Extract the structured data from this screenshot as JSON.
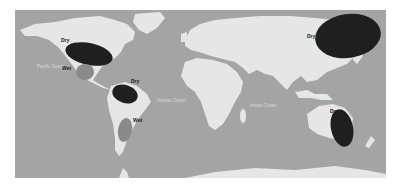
{
  "map": {
    "title": "",
    "colors": {
      "ocean": "#a4a4a4",
      "land": "#e6e6e6",
      "dry": "#1f1f1f",
      "wet": "#8a8a8a",
      "ocean_label": "#d8d8d8",
      "zone_label": "#1a1a1a"
    },
    "oceans": [
      {
        "label": "Pacific Ocean",
        "x": 22,
        "y": 58
      },
      {
        "label": "Atlantic Ocean",
        "x": 142,
        "y": 92
      },
      {
        "label": "Indian Ocean",
        "x": 235,
        "y": 97
      }
    ],
    "zones": [
      {
        "name": "north-america-dry",
        "label": "Dry",
        "type": "dry",
        "cx": 74,
        "cy": 44,
        "rx": 24,
        "ry": 11,
        "rot": 12,
        "lx": 46,
        "ly": 32
      },
      {
        "name": "mexico-wet",
        "label": "Wet",
        "type": "wet",
        "cx": 70,
        "cy": 62,
        "rx": 9,
        "ry": 8,
        "rot": 0,
        "lx": 47,
        "ly": 60
      },
      {
        "name": "northern-south-america-dry",
        "label": "Dry",
        "type": "dry",
        "cx": 110,
        "cy": 84,
        "rx": 13,
        "ry": 9,
        "rot": 18,
        "lx": 116,
        "ly": 73
      },
      {
        "name": "southern-south-america-wet",
        "label": "Wet",
        "type": "wet",
        "cx": 110,
        "cy": 120,
        "rx": 7,
        "ry": 12,
        "rot": 10,
        "lx": 118,
        "ly": 112
      },
      {
        "name": "east-asia-dry",
        "label": "Dry",
        "type": "dry",
        "cx": 333,
        "cy": 26,
        "rx": 33,
        "ry": 22,
        "rot": -8,
        "lx": 292,
        "ly": 28
      },
      {
        "name": "australia-dry",
        "label": "Dry",
        "type": "dry",
        "cx": 327,
        "cy": 118,
        "rx": 11,
        "ry": 19,
        "rot": -12,
        "lx": 315,
        "ly": 103
      }
    ]
  }
}
